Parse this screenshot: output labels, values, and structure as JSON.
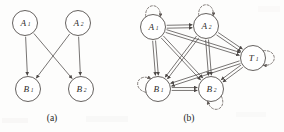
{
  "figure": {
    "width": 284,
    "height": 132,
    "background_color": "#fdfdfc",
    "stroke_color": "#4b4745",
    "node_fill": "#ffffff",
    "node_stroke": "#55504e",
    "selfloop_color": "#6e6763"
  },
  "panels": [
    {
      "id": "panel-a",
      "caption": "(a)",
      "caption_x": 52,
      "caption_y": 121,
      "description": "directed acyclic graph, two parents crossing to two children",
      "nodes": [
        {
          "id": "a1",
          "base": "A",
          "sub": "1",
          "cx": 25,
          "cy": 23,
          "r": 12.5
        },
        {
          "id": "a2",
          "base": "A",
          "sub": "2",
          "cx": 78,
          "cy": 23,
          "r": 12.5
        },
        {
          "id": "b1",
          "base": "B",
          "sub": "1",
          "cx": 28,
          "cy": 89,
          "r": 12.5
        },
        {
          "id": "b2",
          "base": "B",
          "sub": "2",
          "cx": 81,
          "cy": 89,
          "r": 12.5
        }
      ],
      "edges": [
        {
          "from": "a1",
          "to": "b1",
          "arrow": "single"
        },
        {
          "from": "a1",
          "to": "b2",
          "arrow": "single"
        },
        {
          "from": "a2",
          "to": "b1",
          "arrow": "single"
        },
        {
          "from": "a2",
          "to": "b2",
          "arrow": "single"
        }
      ],
      "self_loops": []
    },
    {
      "id": "panel-b",
      "caption": "(b)",
      "caption_x": 189,
      "caption_y": 121,
      "description": "complete directed graph on five nodes with dashed self loops",
      "nodes": [
        {
          "id": "a1",
          "base": "A",
          "sub": "1",
          "cx": 153,
          "cy": 27,
          "r": 12.5
        },
        {
          "id": "a2",
          "base": "A",
          "sub": "2",
          "cx": 206,
          "cy": 26,
          "r": 12.5
        },
        {
          "id": "t1",
          "base": "T",
          "sub": "1",
          "cx": 253,
          "cy": 58,
          "r": 12.5
        },
        {
          "id": "b1",
          "base": "B",
          "sub": "1",
          "cx": 158,
          "cy": 89,
          "r": 12.5
        },
        {
          "id": "b2",
          "base": "B",
          "sub": "2",
          "cx": 211,
          "cy": 89,
          "r": 12.5
        }
      ],
      "edges": [
        {
          "from": "a1",
          "to": "a2",
          "arrow": "double"
        },
        {
          "from": "a1",
          "to": "t1",
          "arrow": "double"
        },
        {
          "from": "a1",
          "to": "b1",
          "arrow": "double"
        },
        {
          "from": "a1",
          "to": "b2",
          "arrow": "double"
        },
        {
          "from": "a2",
          "to": "t1",
          "arrow": "double"
        },
        {
          "from": "a2",
          "to": "b1",
          "arrow": "double"
        },
        {
          "from": "a2",
          "to": "b2",
          "arrow": "double"
        },
        {
          "from": "t1",
          "to": "b1",
          "arrow": "double"
        },
        {
          "from": "t1",
          "to": "b2",
          "arrow": "double"
        },
        {
          "from": "b1",
          "to": "b2",
          "arrow": "double"
        }
      ],
      "self_loops": [
        {
          "node": "a1",
          "angle": -90,
          "style": "dashed"
        },
        {
          "node": "a2",
          "angle": -90,
          "style": "dashed"
        },
        {
          "node": "t1",
          "angle": 0,
          "style": "dashed"
        },
        {
          "node": "b1",
          "angle": 200,
          "style": "dashed"
        },
        {
          "node": "b2",
          "angle": 70,
          "style": "dashed"
        }
      ]
    }
  ]
}
